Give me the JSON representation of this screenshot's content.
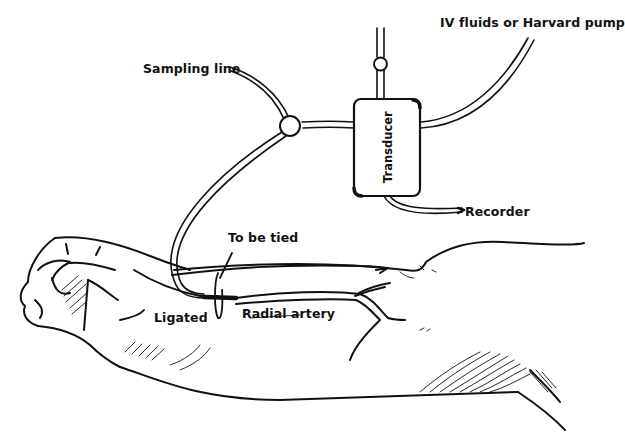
{
  "figure": {
    "labels": {
      "iv_fluids": "IV fluids or Harvard pump",
      "sampling_line": "Sampling line",
      "transducer": "Transducer",
      "recorder": "Recorder",
      "to_be_tied": "To be tied",
      "ligated": "Ligated",
      "radial_artery": "Radial artery"
    },
    "components": [
      {
        "id": "iv-line",
        "name": "IV fluids / Harvard pump line"
      },
      {
        "id": "sampling-line",
        "name": "Sampling line"
      },
      {
        "id": "three-way-stopcock",
        "name": "Stopcock junction"
      },
      {
        "id": "transducer",
        "name": "Transducer"
      },
      {
        "id": "flush-valve",
        "name": "Valve on top of transducer"
      },
      {
        "id": "recorder-line",
        "name": "Cable to recorder"
      },
      {
        "id": "cannula",
        "name": "Cannula in radial artery"
      },
      {
        "id": "forearm",
        "name": "Forearm and hand"
      }
    ],
    "colors": {
      "ink": "#111111",
      "background": "#ffffff"
    }
  }
}
